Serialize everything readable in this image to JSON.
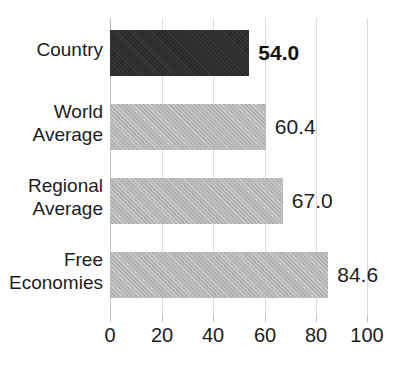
{
  "chart_data": {
    "type": "bar",
    "orientation": "horizontal",
    "title": "",
    "xlabel": "",
    "ylabel": "",
    "xlim": [
      0,
      100
    ],
    "xticks": [
      0,
      20,
      40,
      60,
      80,
      100
    ],
    "xtick_labels": [
      "0",
      "20",
      "40",
      "60",
      "80",
      "100"
    ],
    "grid": true,
    "grid_axis": "x",
    "legend": false,
    "categories": [
      "Country",
      "World Average",
      "Regional Average",
      "Free Economies"
    ],
    "values": [
      54.0,
      60.4,
      67.0,
      84.6
    ],
    "value_labels": [
      "54.0",
      "60.4",
      "67.0",
      "84.6"
    ],
    "bars": [
      {
        "category": "Country",
        "label_line1": "Country",
        "label_line2": "",
        "value": 54.0,
        "value_label": "54.0",
        "color": "#2b2b2b",
        "highlighted": true,
        "bold_label": true
      },
      {
        "category": "World Average",
        "label_line1": "World",
        "label_line2": "Average",
        "value": 60.4,
        "value_label": "60.4",
        "color": "#b4b4b4",
        "highlighted": false,
        "bold_label": false
      },
      {
        "category": "Regional Average",
        "label_line1": "Regional",
        "label_line2": "Average",
        "value": 67.0,
        "value_label": "67.0",
        "color": "#b4b4b4",
        "highlighted": false,
        "bold_label": false
      },
      {
        "category": "Free Economies",
        "label_line1": "Free",
        "label_line2": "Economies",
        "value": 84.6,
        "value_label": "84.6",
        "color": "#b4b4b4",
        "highlighted": false,
        "bold_label": false
      }
    ]
  },
  "colors": {
    "highlight_bar": "#2b2b2b",
    "normal_bar": "#b4b4b4",
    "gridline": "#dcdcdc",
    "axis": "#c2c2c2",
    "text": "#1d1d1d",
    "background": "#ffffff"
  }
}
